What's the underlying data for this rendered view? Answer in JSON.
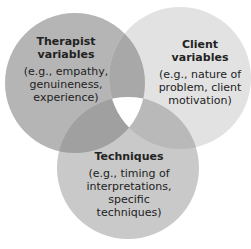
{
  "diagram": {
    "type": "venn",
    "sets": [
      {
        "id": "therapist",
        "title": "Therapist variables",
        "description": "(e.g., empathy, genuineness, experience)",
        "color": "#b5b5b5"
      },
      {
        "id": "client",
        "title": "Client variables",
        "description": "(e.g., nature of problem, client motivation)",
        "color": "#e2e2e2"
      },
      {
        "id": "techniques",
        "title": "Techniques",
        "description": "(e.g., timing of interpretations, specific techniques)",
        "color": "#c9c9c9"
      }
    ],
    "overlaps": {
      "therapist_client": "#a6a6a6",
      "therapist_techniques": "#9e9e9e",
      "client_techniques": "#b8b8b8",
      "all": "#ffffff"
    }
  }
}
